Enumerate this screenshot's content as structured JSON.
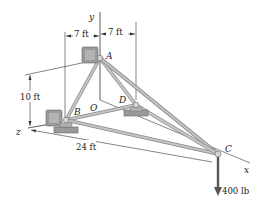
{
  "diagram": {
    "type": "3D truss statics problem",
    "axes": {
      "x": "x",
      "y": "y",
      "z": "z",
      "origin": "O"
    },
    "points": {
      "A": "A",
      "B": "B",
      "C": "C",
      "D": "D",
      "O": "O"
    },
    "dimensions": {
      "left_offset": "7 ft",
      "right_offset": "7 ft",
      "height": "10 ft",
      "length": "24 ft"
    },
    "load": {
      "label": "400 lb",
      "point": "C",
      "direction": "down"
    },
    "colors": {
      "member": "#b9b9b9",
      "member_edge": "#8a8a8a",
      "support": "#9c9c9c",
      "line": "#333333"
    }
  }
}
